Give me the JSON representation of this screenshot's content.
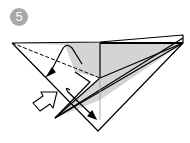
{
  "step": {
    "number": "5"
  },
  "diagram": {
    "type": "origami-fold-step",
    "colors": {
      "paper_shade": "#d4d4d4",
      "line": "#000000",
      "badge": "#a8a8a8"
    },
    "annotations": [
      "valley-fold-dashed-line",
      "fold-arrow",
      "push-arrow",
      "mountain-fold-line"
    ]
  }
}
